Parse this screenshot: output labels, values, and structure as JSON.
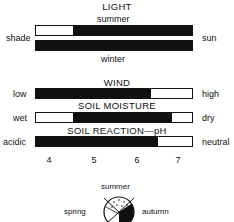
{
  "light": {
    "title": "LIGHT",
    "top_label": "summer",
    "bottom_label": "winter",
    "left": "shade",
    "right": "sun",
    "summer_fill": [
      0.24,
      1.0
    ],
    "winter_fill": [
      0.0,
      1.0
    ]
  },
  "wind": {
    "title": "WIND",
    "left": "low",
    "right": "high",
    "fill": [
      0.0,
      0.74
    ]
  },
  "soil_moisture": {
    "title": "SOIL MOISTURE",
    "left": "wet",
    "right": "dry",
    "fill": [
      0.24,
      0.87
    ]
  },
  "soil_reaction": {
    "title": "SOIL REACTION—pH",
    "left": "acidic",
    "right": "neutral",
    "fill": [
      0.0,
      0.78
    ]
  },
  "ph_ticks": [
    "4",
    "5",
    "6",
    "7"
  ],
  "seasons": {
    "top": "summer",
    "left": "spring",
    "right": "autumn"
  }
}
